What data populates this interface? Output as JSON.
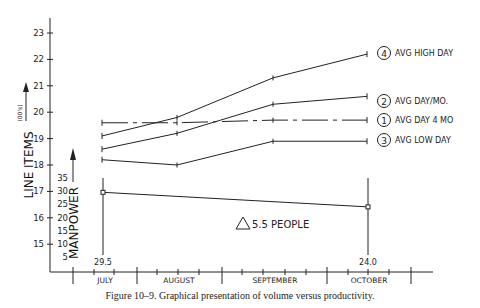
{
  "chart_data": {
    "type": "line",
    "title": "",
    "caption": "Figure 10–9.   Graphical presentation of volume versus productivity.",
    "categories": [
      "JULY",
      "AUGUST",
      "SEPTEMBER",
      "OCTOBER"
    ],
    "ylabel": "LINE ITEMS",
    "ylabel_units": "(00's)",
    "ylim": [
      15,
      23
    ],
    "yticks": [
      15,
      16,
      17,
      18,
      19,
      20,
      21,
      22,
      23
    ],
    "series": [
      {
        "id": 4,
        "name": "AVG HIGH DAY",
        "style": "solid",
        "values": [
          19.1,
          19.8,
          21.3,
          22.2
        ]
      },
      {
        "id": 2,
        "name": "AVG DAY/MO.",
        "style": "solid",
        "values": [
          18.6,
          19.2,
          20.3,
          20.6
        ]
      },
      {
        "id": 1,
        "name": "AVG DAY 4 MO",
        "style": "dash-dot",
        "values": [
          19.6,
          19.6,
          19.7,
          19.7
        ]
      },
      {
        "id": 3,
        "name": "AVG LOW DAY",
        "style": "solid",
        "values": [
          18.2,
          18.0,
          18.9,
          18.9
        ]
      }
    ],
    "secondary_axis": {
      "label": "MANPOWER",
      "ticks": [
        5,
        10,
        15,
        20,
        25,
        30,
        35
      ],
      "series": {
        "name": "MANPOWER",
        "points": [
          {
            "category": "JULY",
            "value": 29.5,
            "label": "29.5"
          },
          {
            "category": "OCTOBER",
            "value": 24.0,
            "label": "24.0"
          }
        ]
      }
    },
    "annotations": [
      {
        "text": "5.5 PEOPLE",
        "symbol": "triangle-delta"
      }
    ],
    "grid": false,
    "legend_position": "right, inline at line ends"
  }
}
